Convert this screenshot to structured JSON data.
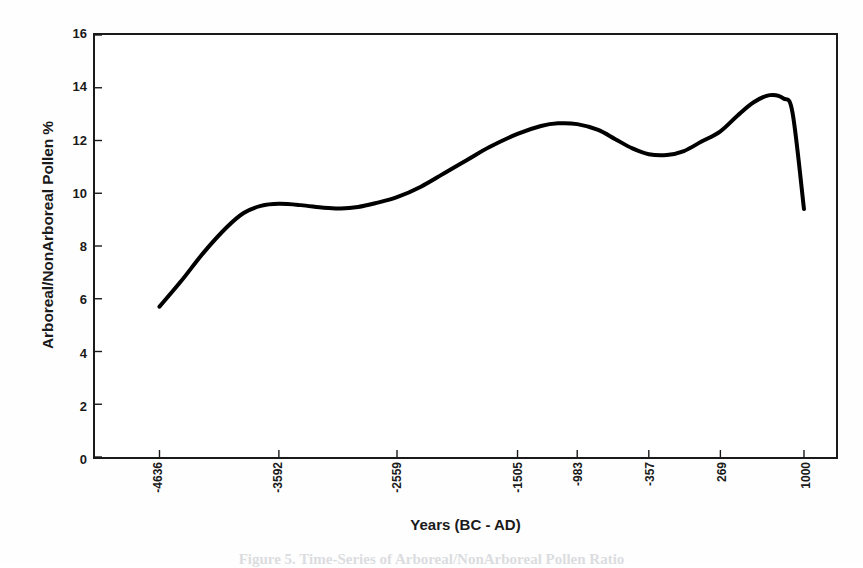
{
  "figure": {
    "background_color": "#fefefe",
    "ink_color": "#1a1a1a",
    "caption_partial": "Figure 5. Time-Series of Arboreal/NonArboreal Pollen Ratio"
  },
  "chart_data": {
    "type": "line",
    "title": "",
    "subtitle": "",
    "xlabel": "Years (BC - AD)",
    "ylabel": "Arboreal/NonArboreal Pollen %",
    "xlim": [
      -5200,
      1280
    ],
    "ylim": [
      0,
      16
    ],
    "grid": false,
    "legend": null,
    "legend_position": "none",
    "line_color": "#000000",
    "line_width_px": 4,
    "x_tick_labels": [
      "-4636",
      "-3592",
      "-2559",
      "-1505",
      "-983",
      "-357",
      "269",
      "1000"
    ],
    "x_tick_values": [
      -4636,
      -3592,
      -2559,
      -1505,
      -983,
      -357,
      269,
      1000
    ],
    "y_tick_labels": [
      "0",
      "2",
      "4",
      "6",
      "8",
      "10",
      "12",
      "14",
      "16"
    ],
    "y_tick_values": [
      0,
      2,
      4,
      6,
      8,
      10,
      12,
      14,
      16
    ],
    "series": [
      {
        "name": "Arboreal/NonArboreal Pollen %",
        "x": [
          -4636,
          -4450,
          -4250,
          -4050,
          -3900,
          -3750,
          -3592,
          -3400,
          -3200,
          -3050,
          -2900,
          -2750,
          -2559,
          -2350,
          -2150,
          -1950,
          -1750,
          -1505,
          -1300,
          -1150,
          -983,
          -800,
          -650,
          -500,
          -357,
          -200,
          -50,
          100,
          269,
          420,
          560,
          700,
          820,
          900,
          1000
        ],
        "y": [
          5.7,
          6.65,
          7.75,
          8.7,
          9.25,
          9.52,
          9.6,
          9.55,
          9.45,
          9.42,
          9.48,
          9.62,
          9.85,
          10.25,
          10.75,
          11.25,
          11.75,
          12.25,
          12.55,
          12.65,
          12.62,
          12.4,
          12.05,
          11.7,
          11.48,
          11.45,
          11.6,
          11.95,
          12.35,
          12.95,
          13.45,
          13.72,
          13.6,
          13.05,
          9.4
        ],
        "value_range": [
          5.7,
          13.75
        ],
        "start_value": 5.7,
        "end_value": 9.4,
        "local_maxima": [
          {
            "x": -3592,
            "y": 9.6
          },
          {
            "x": -1150,
            "y": 12.65
          },
          {
            "x": 700,
            "y": 13.75
          }
        ],
        "local_minima": [
          {
            "x": -3050,
            "y": 9.42
          },
          {
            "x": -200,
            "y": 11.45
          }
        ]
      }
    ]
  }
}
